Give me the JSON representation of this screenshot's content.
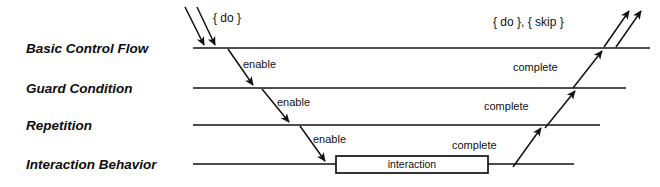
{
  "diagram": {
    "colors": {
      "stroke": "#111111",
      "background": "#ffffff",
      "box_fill": "#ffffff"
    },
    "rows": [
      {
        "id": "basic-control-flow",
        "label": "Basic Control Flow",
        "y": 48
      },
      {
        "id": "guard-condition",
        "label": "Guard Condition",
        "y": 88
      },
      {
        "id": "repetition",
        "label": "Repetition",
        "y": 125
      },
      {
        "id": "interaction-behavior",
        "label": "Interaction Behavior",
        "y": 164
      }
    ],
    "tokens": {
      "incoming": "{ do }",
      "outgoing": "{ do }, { skip }"
    },
    "edges": [
      {
        "id": "enable-1",
        "label": "enable"
      },
      {
        "id": "enable-2",
        "label": "enable"
      },
      {
        "id": "enable-3",
        "label": "enable"
      },
      {
        "id": "complete-1",
        "label": "complete"
      },
      {
        "id": "complete-2",
        "label": "complete"
      },
      {
        "id": "complete-3",
        "label": "complete"
      }
    ],
    "interaction_box": {
      "label": "interaction",
      "x": 336,
      "y": 156,
      "width": 152,
      "height": 17
    }
  }
}
